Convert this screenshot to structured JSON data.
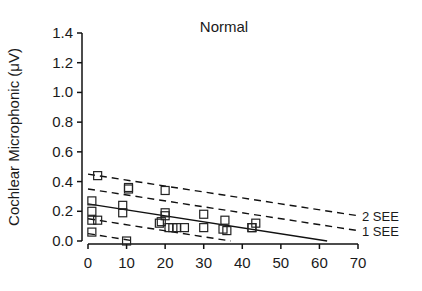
{
  "chart_data": {
    "type": "scatter",
    "title": "Normal",
    "xlabel": "",
    "ylabel": "Cochlear Microphonic (μV)",
    "xlim": [
      0,
      70
    ],
    "ylim": [
      0.0,
      1.4
    ],
    "xticks": [
      0,
      10,
      20,
      30,
      40,
      50,
      60,
      70
    ],
    "yticks": [
      0.0,
      0.2,
      0.4,
      0.6,
      0.8,
      1.0,
      1.2,
      1.4
    ],
    "ytick_labels": [
      "0.0",
      "0.2",
      "0.4",
      "0.6",
      "0.8",
      "1.0",
      "1.2",
      "1.4"
    ],
    "grid": false,
    "series": [
      {
        "name": "data",
        "marker": "open-square",
        "points": [
          [
            2.5,
            0.44
          ],
          [
            1,
            0.27
          ],
          [
            1,
            0.2
          ],
          [
            1,
            0.14
          ],
          [
            2.5,
            0.14
          ],
          [
            1,
            0.06
          ],
          [
            9,
            0.24
          ],
          [
            9,
            0.19
          ],
          [
            10.5,
            0.36
          ],
          [
            10.5,
            0.35
          ],
          [
            10,
            0.0
          ],
          [
            20,
            0.34
          ],
          [
            20,
            0.19
          ],
          [
            20,
            0.17
          ],
          [
            19,
            0.13
          ],
          [
            18.5,
            0.12
          ],
          [
            21,
            0.09
          ],
          [
            22,
            0.09
          ],
          [
            23,
            0.09
          ],
          [
            25,
            0.09
          ],
          [
            30,
            0.18
          ],
          [
            30,
            0.09
          ],
          [
            35.5,
            0.14
          ],
          [
            35,
            0.08
          ],
          [
            36,
            0.07
          ],
          [
            43.5,
            0.12
          ],
          [
            42.5,
            0.09
          ],
          [
            42.5,
            0.09
          ]
        ]
      }
    ],
    "lines": [
      {
        "name": "regression",
        "style": "solid",
        "from": [
          0,
          0.25
        ],
        "to": [
          62,
          0.0
        ]
      },
      {
        "name": "+2 SEE",
        "style": "dashed",
        "from": [
          0,
          0.45
        ],
        "to": [
          70,
          0.17
        ],
        "label": "2 SEE"
      },
      {
        "name": "+1 SEE",
        "style": "dashed",
        "from": [
          0,
          0.35
        ],
        "to": [
          70,
          0.07
        ],
        "label": "1 SEE"
      },
      {
        "name": "-1 SEE",
        "style": "dashed",
        "from": [
          0,
          0.15
        ],
        "to": [
          37,
          0.0
        ]
      },
      {
        "name": "-2 SEE",
        "style": "dashed",
        "from": [
          0,
          0.05
        ],
        "to": [
          12,
          0.0
        ]
      }
    ],
    "annotations": [
      "2 SEE",
      "1 SEE"
    ],
    "legend": "none"
  }
}
